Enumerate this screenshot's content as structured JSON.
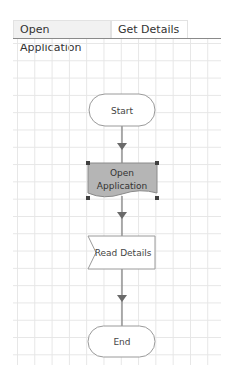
{
  "tabs": [
    {
      "label": "Open Application",
      "active": false
    },
    {
      "label": "Get Details",
      "active": true
    }
  ],
  "flowchart": {
    "nodes": [
      {
        "id": "start",
        "type": "terminator",
        "label": "Start"
      },
      {
        "id": "open_app",
        "type": "document",
        "label_line1": "Open",
        "label_line2": "Application",
        "selected": true,
        "fill": "#b5b5b5"
      },
      {
        "id": "read_details",
        "type": "read",
        "label": "Read Details"
      },
      {
        "id": "end",
        "type": "terminator",
        "label": "End"
      }
    ],
    "colors": {
      "line": "#7a7a7a",
      "node_border": "#9a9a9a",
      "selected_fill": "#b5b5b5",
      "handle": "#404040",
      "grid": "#e6e6e6"
    }
  }
}
